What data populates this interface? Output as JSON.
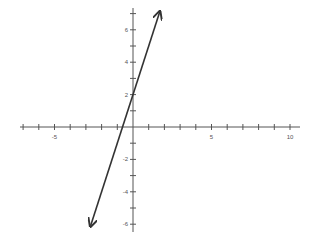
{
  "chart_data": {
    "type": "line",
    "title": "",
    "xlabel": "",
    "ylabel": "",
    "xlim": [
      -7.3,
      10.5
    ],
    "ylim": [
      -6.6,
      7.5
    ],
    "grid": false,
    "legend": null,
    "x_ticks": [
      -7,
      -6,
      -5,
      -4,
      -3,
      -2,
      -1,
      1,
      2,
      3,
      4,
      5,
      6,
      7,
      8,
      9,
      10
    ],
    "x_tick_labels": [
      {
        "value": -5,
        "label": "-5"
      },
      {
        "value": 5,
        "label": "5"
      },
      {
        "value": 10,
        "label": "10"
      }
    ],
    "y_ticks": [
      -6,
      -5,
      -4,
      -3,
      -2,
      -1,
      1,
      2,
      3,
      4,
      5,
      6,
      7
    ],
    "y_tick_labels": [
      {
        "value": 6,
        "label": "6"
      },
      {
        "value": 4,
        "label": "4"
      },
      {
        "value": 2,
        "label": "2"
      },
      {
        "value": -2,
        "label": "-2"
      },
      {
        "value": -4,
        "label": "-4"
      },
      {
        "value": -6,
        "label": "-6"
      }
    ],
    "series": [
      {
        "name": "line",
        "equation_estimate": "y = 3x + 2",
        "arrows_both_ends": true,
        "x": [
          -2.7,
          1.7
        ],
        "y": [
          -6.1,
          7.1
        ]
      }
    ]
  },
  "axes": {
    "origin_px": [
      133,
      127
    ],
    "x_unit_px": 15.7,
    "y_unit_px": 16.2,
    "x_axis_px": [
      20,
      300
    ],
    "y_axis_px": [
      8,
      232
    ]
  },
  "colors": {
    "axis": "#555555",
    "line": "#333333",
    "background": "#ffffff"
  }
}
